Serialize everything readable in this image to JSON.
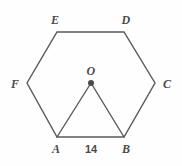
{
  "figure": {
    "background_color": "#fefefe",
    "stroke_color": "#595959",
    "label_color": "#4a4a4a",
    "stroke_width": 1.4,
    "width": 182,
    "height": 166
  },
  "hexagon": {
    "name": "regular-hexagon",
    "vertices": [
      {
        "id": "A",
        "label": "A",
        "x": 57,
        "y": 137,
        "label_x": 56,
        "label_y": 149
      },
      {
        "id": "B",
        "label": "B",
        "x": 124,
        "y": 137,
        "label_x": 126,
        "label_y": 149
      },
      {
        "id": "C",
        "label": "C",
        "x": 155,
        "y": 83,
        "label_x": 167,
        "label_y": 84
      },
      {
        "id": "D",
        "label": "D",
        "x": 124,
        "y": 32,
        "label_x": 126,
        "label_y": 20
      },
      {
        "id": "E",
        "label": "E",
        "x": 57,
        "y": 32,
        "label_x": 55,
        "label_y": 20
      },
      {
        "id": "F",
        "label": "F",
        "x": 27,
        "y": 83,
        "label_x": 15,
        "label_y": 84
      }
    ],
    "path": "M 57 137 L 124 137 L 155 83 L 124 32 L 57 32 L 27 83 Z"
  },
  "center": {
    "id": "O",
    "label": "O",
    "x": 91,
    "y": 83,
    "label_x": 91,
    "label_y": 71,
    "dot_radius": 3
  },
  "triangle": {
    "name": "triangle-oab",
    "path": "M 91 83 L 57 137 M 91 83 L 124 137"
  },
  "measurements": [
    {
      "id": "AB",
      "value": "14",
      "x": 91,
      "y": 149
    }
  ]
}
